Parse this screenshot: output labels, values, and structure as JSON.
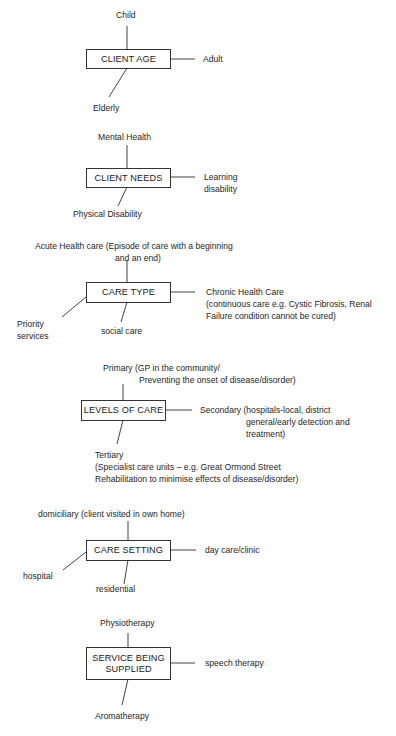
{
  "diagram": {
    "groups": [
      {
        "id": "client-age",
        "title": "CLIENT AGE",
        "top": "Child",
        "right": "Adult",
        "bottom": "Elderly"
      },
      {
        "id": "client-needs",
        "title": "CLIENT NEEDS",
        "top": "Mental Health",
        "right_lines": [
          "Learning",
          "disability"
        ],
        "bottom": "Physical Disability"
      },
      {
        "id": "care-type",
        "title": "CARE TYPE",
        "top_lines": [
          "Acute Health care  (Episode of care with a beginning",
          "and an end)"
        ],
        "right_lines": [
          "Chronic Health Care",
          "(continuous care e.g. Cystic Fibrosis, Renal",
          "Failure condition cannot be cured)"
        ],
        "bottom": "social care",
        "left_lines": [
          "Priority",
          "services"
        ]
      },
      {
        "id": "levels-of-care",
        "title": "LEVELS OF CARE",
        "top_lines": [
          "Primary (GP in the community/",
          "Preventing the onset of disease/disorder)"
        ],
        "right_lines": [
          "Secondary (hospitals-local, district",
          "general/early detection and",
          "treatment)"
        ],
        "bottom_lines": [
          "Tertiary",
          "(Specialist care units – e.g. Great Ormond Street",
          "Rehabilitation to minimise effects of disease/disorder)"
        ]
      },
      {
        "id": "care-setting",
        "title": "CARE SETTING",
        "top": "domiciliary (client visited in own home)",
        "right": "day care/clinic",
        "bottom": "residential",
        "left": "hospital"
      },
      {
        "id": "service-being-supplied",
        "title_lines": [
          "SERVICE BEING",
          "SUPPLIED"
        ],
        "top": "Physiotherapy",
        "right": "speech therapy",
        "bottom": "Aromatherapy"
      }
    ]
  }
}
